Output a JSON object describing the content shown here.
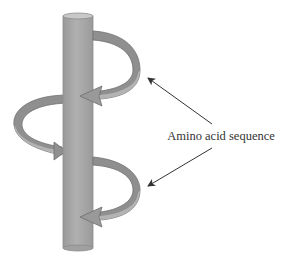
{
  "diagram": {
    "label": "Amino acid sequence",
    "colors": {
      "cylinder_fill": "#a6a6a6",
      "cylinder_edge": "#8c8c8c",
      "cylinder_top": "#c8c8c8",
      "ribbon_fill": "#8f8f8f",
      "ribbon_edge": "#6e6e6e",
      "ribbon_inner": "#b3b3b3",
      "pointer_line": "#333333"
    },
    "elements": [
      {
        "name": "helix-axis-cylinder"
      },
      {
        "name": "helical-turn-arrow",
        "count": 4
      },
      {
        "name": "pointer-arrow",
        "count": 2
      }
    ]
  }
}
